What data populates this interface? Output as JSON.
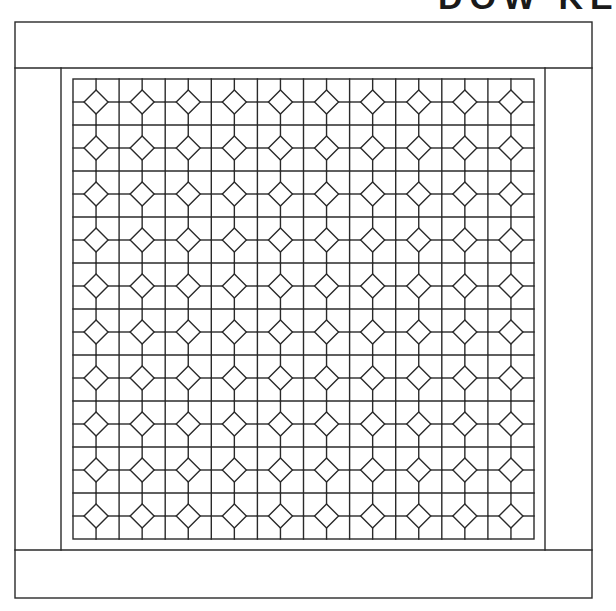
{
  "heading": {
    "text": "DOW KE",
    "clipped": true
  },
  "quilt": {
    "title": "Quilt layout diagram",
    "line_color": "#2a2a2a",
    "background": "#ffffff",
    "outer_frame": {
      "x": 15,
      "y": 22,
      "width": 577,
      "height": 576
    },
    "top_border": {
      "y_top": 22,
      "y_bottom": 68
    },
    "bottom_border": {
      "y_top": 550,
      "y_bottom": 598
    },
    "side_borders": {
      "left_x": 15,
      "right_x": 592,
      "inner_left_x": 61,
      "inner_right_x": 545
    },
    "sashing": {
      "x": 61,
      "y": 68,
      "width": 484,
      "height": 482
    },
    "grid": {
      "x": 73,
      "y": 79,
      "width": 461,
      "height": 460,
      "columns": 10,
      "rows": 10,
      "diamond_half_diagonal": 12,
      "block_name": "Diamond-in-square block"
    }
  }
}
